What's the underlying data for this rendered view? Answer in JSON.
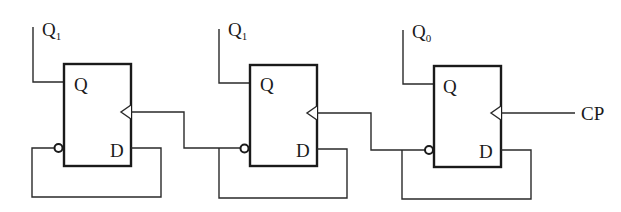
{
  "diagram": {
    "type": "circuit",
    "colors": {
      "line": "#2a2a2a",
      "background": "#ffffff"
    },
    "flip_flops": [
      {
        "id": "ff1",
        "output_label": "Q",
        "output_sub": "1",
        "q_pin": "Q",
        "d_pin": "D"
      },
      {
        "id": "ff2",
        "output_label": "Q",
        "output_sub": "1",
        "q_pin": "Q",
        "d_pin": "D"
      },
      {
        "id": "ff3",
        "output_label": "Q",
        "output_sub": "0",
        "q_pin": "Q",
        "d_pin": "D"
      }
    ],
    "clock_input": {
      "label": "CP"
    }
  }
}
